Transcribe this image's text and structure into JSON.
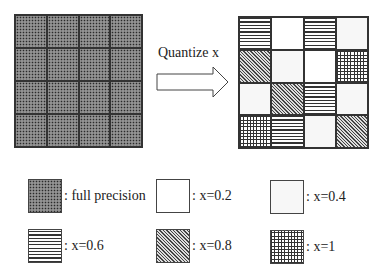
{
  "arrow": {
    "label": "Quantize x"
  },
  "input_grid": {
    "rows": 4,
    "cols": 4,
    "cells": [
      [
        "full",
        "full",
        "full",
        "full"
      ],
      [
        "full",
        "full",
        "full",
        "full"
      ],
      [
        "full",
        "full",
        "full",
        "full"
      ],
      [
        "full",
        "full",
        "full",
        "full"
      ]
    ]
  },
  "output_grid": {
    "rows": 4,
    "cols": 4,
    "cells": [
      [
        "x06",
        "x02",
        "x06",
        "x04"
      ],
      [
        "x08",
        "x04",
        "x02",
        "x1"
      ],
      [
        "x04",
        "x08",
        "x06",
        "x04"
      ],
      [
        "x1",
        "x06",
        "x04",
        "x08"
      ]
    ]
  },
  "legend": [
    {
      "pattern": "full",
      "label": ": full precision"
    },
    {
      "pattern": "x02",
      "label": ": x=0.2"
    },
    {
      "pattern": "x04",
      "label": ": x=0.4"
    },
    {
      "pattern": "x06",
      "label": ": x=0.6"
    },
    {
      "pattern": "x08",
      "label": ": x=0.8"
    },
    {
      "pattern": "x1",
      "label": ": x=1"
    }
  ]
}
